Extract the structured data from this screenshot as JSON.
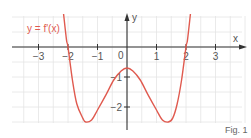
{
  "chart_data": {
    "type": "line",
    "title": "",
    "function_label": "y = f'(x)",
    "xlabel": "x",
    "ylabel": "y",
    "xlim": [
      -4,
      4
    ],
    "ylim": [
      -2.6,
      1.1
    ],
    "grid": true,
    "grid_step": 0.5,
    "x_ticks": [
      -3,
      -2,
      -1,
      1,
      2,
      3
    ],
    "x_tick_labels": [
      "−3",
      "−2",
      "−1",
      "1",
      "2",
      "3"
    ],
    "y_ticks": [
      -1,
      -2
    ],
    "y_tick_labels": [
      "−1",
      "−2"
    ],
    "origin_label": "0",
    "series": [
      {
        "name": "y = f'(x)",
        "color": "#e05a4f",
        "x": [
          -2.15,
          -2.05,
          -2.0,
          -1.85,
          -1.7,
          -1.5,
          -1.4,
          -1.2,
          -1.0,
          -0.7,
          -0.45,
          -0.2,
          0,
          0.2,
          0.45,
          0.7,
          1.0,
          1.2,
          1.4,
          1.55,
          1.7,
          1.85,
          2.0,
          2.05,
          2.15
        ],
        "y": [
          1.1,
          0.23,
          0,
          -1.1,
          -1.9,
          -2.37,
          -2.5,
          -2.43,
          -2.1,
          -1.57,
          -1.1,
          -0.8,
          -0.7,
          -0.8,
          -1.1,
          -1.57,
          -2.1,
          -2.43,
          -2.5,
          -2.37,
          -1.9,
          -1.1,
          0,
          0.23,
          1.1
        ]
      }
    ],
    "annotations": [
      "Fig. 1"
    ]
  },
  "figure": {
    "caption": "Fig. 1",
    "axis_color": "#333333",
    "grid_color": "#e2e2e2",
    "curve_color": "#e05a4f"
  }
}
